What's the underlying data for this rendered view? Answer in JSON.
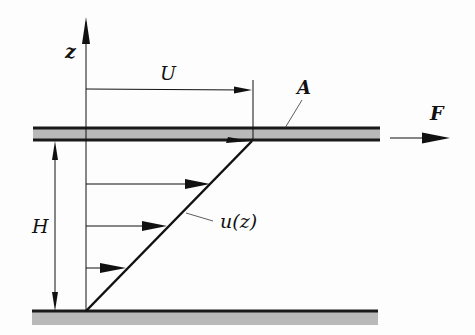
{
  "diagram": {
    "labels": {
      "z_axis": "z",
      "velocity_scale": "U",
      "area": "A",
      "force": "F",
      "gap_height": "H",
      "profile": "u(z)"
    },
    "colors": {
      "line": "#111111",
      "plate_fill": "#b9b9b9",
      "plate_border": "#1a1a1a",
      "background": "#fdfdfd"
    },
    "plates": [
      {
        "name": "top-plate",
        "x": 33,
        "y": 127,
        "width": 347,
        "height": 14,
        "moving": true
      },
      {
        "name": "bottom-plate",
        "x": 32,
        "y": 311,
        "width": 346,
        "height": 14,
        "moving": false
      }
    ],
    "velocity_arrows": [
      {
        "z_y": 268,
        "tip_x": 119
      },
      {
        "z_y": 226,
        "tip_x": 166
      },
      {
        "z_y": 184,
        "tip_x": 211
      },
      {
        "z_y": 141,
        "tip_x": 252
      }
    ]
  }
}
